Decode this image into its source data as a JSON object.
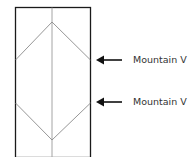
{
  "diagram": {
    "labels": [
      {
        "text": "Mountain V",
        "arrow": "arrow-left-icon"
      },
      {
        "text": "Mountain V",
        "arrow": "arrow-left-icon"
      }
    ],
    "colors": {
      "border": "#1a1a1a",
      "fold_line": "#8a8a8a",
      "arrow": "#111111",
      "text": "#333333"
    }
  }
}
